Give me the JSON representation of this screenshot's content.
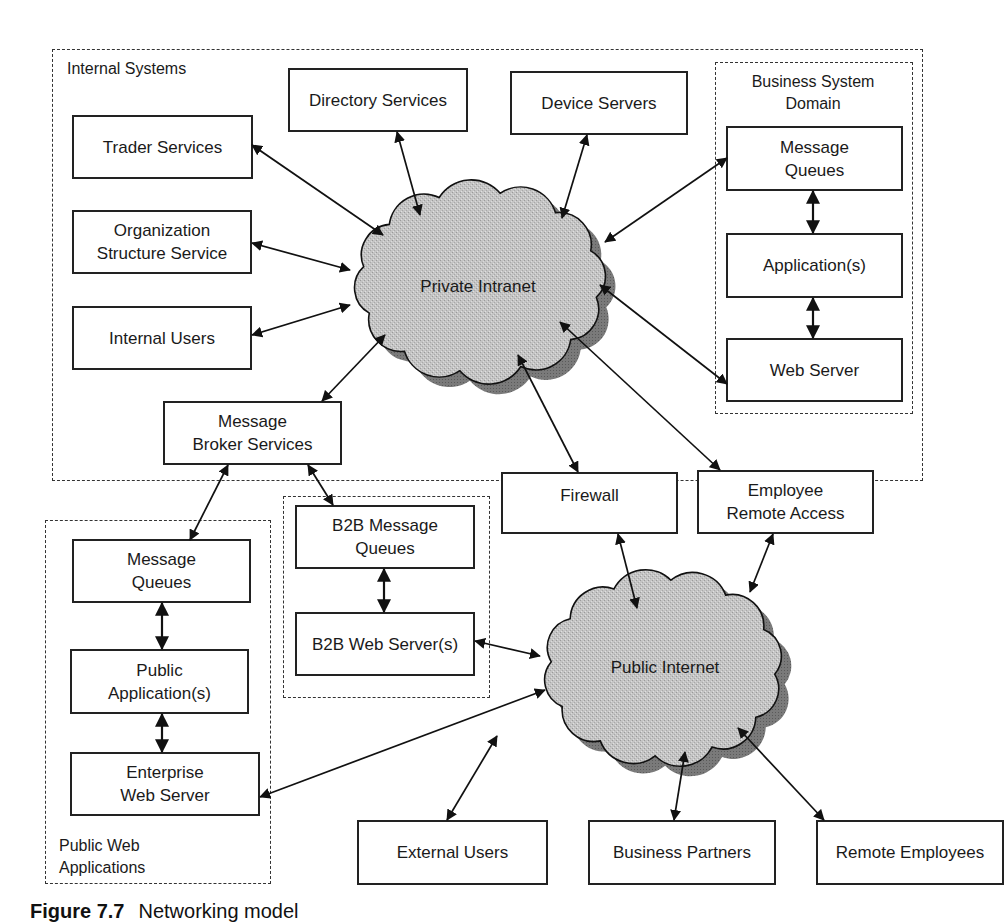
{
  "figure": {
    "caption_number": "Figure 7.7",
    "caption_text": "Networking model"
  },
  "groups": {
    "internal_systems": "Internal Systems",
    "business_system_domain": "Business System\nDomain",
    "public_web_applications": "Public Web\nApplications"
  },
  "clouds": {
    "private_intranet": "Private Intranet",
    "public_internet": "Public Internet"
  },
  "nodes": {
    "trader_services": "Trader Services",
    "directory_services": "Directory Services",
    "device_servers": "Device Servers",
    "organization_structure_service": "Organization\nStructure Service",
    "internal_users": "Internal Users",
    "message_broker_services": "Message\nBroker Services",
    "bsd_message_queues": "Message\nQueues",
    "bsd_applications": "Application(s)",
    "bsd_web_server": "Web Server",
    "firewall": "Firewall",
    "employee_remote_access": "Employee\nRemote Access",
    "b2b_message_queues": "B2B Message\nQueues",
    "b2b_web_servers": "B2B Web Server(s)",
    "pub_message_queues": "Message\nQueues",
    "public_applications": "Public\nApplication(s)",
    "enterprise_web_server": "Enterprise\nWeb Server",
    "external_users": "External Users",
    "business_partners": "Business Partners",
    "remote_employees": "Remote Employees"
  },
  "connections": [
    {
      "from": "trader_services",
      "to": "private_intranet",
      "type": "bidirectional"
    },
    {
      "from": "directory_services",
      "to": "private_intranet",
      "type": "bidirectional"
    },
    {
      "from": "device_servers",
      "to": "private_intranet",
      "type": "bidirectional"
    },
    {
      "from": "organization_structure_service",
      "to": "private_intranet",
      "type": "bidirectional"
    },
    {
      "from": "internal_users",
      "to": "private_intranet",
      "type": "bidirectional"
    },
    {
      "from": "message_broker_services",
      "to": "private_intranet",
      "type": "bidirectional"
    },
    {
      "from": "bsd_message_queues",
      "to": "private_intranet",
      "type": "bidirectional"
    },
    {
      "from": "bsd_web_server",
      "to": "private_intranet",
      "type": "bidirectional"
    },
    {
      "from": "bsd_message_queues",
      "to": "bsd_applications",
      "type": "bidirectional"
    },
    {
      "from": "bsd_applications",
      "to": "bsd_web_server",
      "type": "bidirectional"
    },
    {
      "from": "firewall",
      "to": "private_intranet",
      "type": "bidirectional"
    },
    {
      "from": "employee_remote_access",
      "to": "private_intranet",
      "type": "bidirectional"
    },
    {
      "from": "message_broker_services",
      "to": "pub_message_queues",
      "type": "bidirectional"
    },
    {
      "from": "message_broker_services",
      "to": "b2b_message_queues",
      "type": "bidirectional"
    },
    {
      "from": "b2b_message_queues",
      "to": "b2b_web_servers",
      "type": "bidirectional"
    },
    {
      "from": "pub_message_queues",
      "to": "public_applications",
      "type": "bidirectional"
    },
    {
      "from": "public_applications",
      "to": "enterprise_web_server",
      "type": "bidirectional"
    },
    {
      "from": "firewall",
      "to": "public_internet",
      "type": "bidirectional"
    },
    {
      "from": "employee_remote_access",
      "to": "public_internet",
      "type": "bidirectional"
    },
    {
      "from": "b2b_web_servers",
      "to": "public_internet",
      "type": "bidirectional"
    },
    {
      "from": "enterprise_web_server",
      "to": "public_internet",
      "type": "bidirectional"
    },
    {
      "from": "external_users",
      "to": "public_internet",
      "type": "bidirectional"
    },
    {
      "from": "business_partners",
      "to": "public_internet",
      "type": "bidirectional"
    },
    {
      "from": "remote_employees",
      "to": "public_internet",
      "type": "bidirectional"
    }
  ]
}
